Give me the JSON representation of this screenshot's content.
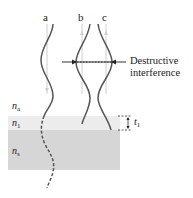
{
  "figure": {
    "waves": [
      {
        "id": "a",
        "label": "a"
      },
      {
        "id": "b",
        "label": "b"
      },
      {
        "id": "c",
        "label": "c"
      }
    ],
    "annotation": {
      "line1": "Destructive",
      "line2": "interference"
    },
    "layers": [
      {
        "id": "ambient",
        "symbol": "n",
        "subscript": "a",
        "color": "#ffffff"
      },
      {
        "id": "film",
        "symbol": "n",
        "subscript": "1",
        "color": "#ececec"
      },
      {
        "id": "substrate",
        "symbol": "n",
        "subscript": "s",
        "color": "#d6d6d6"
      }
    ],
    "thickness": {
      "symbol": "t",
      "subscript": "1"
    },
    "colors": {
      "wave": "#555555",
      "guide": "#cccccc",
      "text": "#222222"
    }
  }
}
